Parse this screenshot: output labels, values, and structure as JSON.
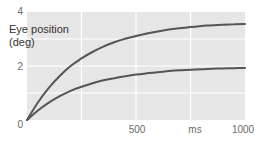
{
  "chart_data": {
    "type": "line",
    "title": "",
    "xlabel": "ms",
    "ylabel": "Eye position (deg)",
    "ylabel_lines": [
      "Eye position",
      "(deg)"
    ],
    "xlim": [
      0,
      1000
    ],
    "ylim": [
      0,
      4
    ],
    "x_ticks": [
      0,
      500,
      1000
    ],
    "x_tick_labels": [
      "0",
      "500",
      "1000"
    ],
    "y_ticks": [
      0,
      2,
      4
    ],
    "y_tick_labels": [
      "0",
      "2",
      "4"
    ],
    "grid": true,
    "grid_x": [
      250,
      500,
      750
    ],
    "grid_y": [
      1,
      2,
      3
    ],
    "legend": null,
    "x": [
      0,
      50,
      100,
      150,
      200,
      250,
      300,
      350,
      400,
      450,
      500,
      550,
      600,
      650,
      700,
      750,
      800,
      850,
      900,
      950,
      1000
    ],
    "series": [
      {
        "name": "upper curve",
        "values": [
          0,
          0.65,
          1.19,
          1.63,
          2.0,
          2.28,
          2.52,
          2.72,
          2.88,
          3.01,
          3.11,
          3.2,
          3.28,
          3.35,
          3.4,
          3.44,
          3.48,
          3.51,
          3.53,
          3.55,
          3.56
        ]
      },
      {
        "name": "lower curve",
        "values": [
          0,
          0.35,
          0.64,
          0.88,
          1.08,
          1.23,
          1.36,
          1.47,
          1.55,
          1.62,
          1.68,
          1.73,
          1.77,
          1.81,
          1.84,
          1.86,
          1.88,
          1.9,
          1.91,
          1.92,
          1.93
        ]
      }
    ],
    "colors": {
      "plot_background": "#e6e6e6",
      "grid": "#ffffff",
      "line": "#555555",
      "tick_text": "#6a6a6a",
      "label_text": "#333333"
    }
  }
}
